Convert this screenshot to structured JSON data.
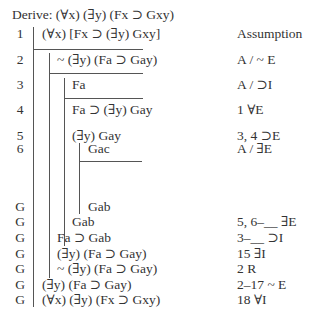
{
  "header": {
    "derive_label": "Derive: (∀x) (∃y) (Fx ⊃ Gxy)"
  },
  "rows": [
    {
      "num": "1",
      "formula": "(∀x) [Fx ⊃ (∃y) Gxy]",
      "just": "Assumption"
    },
    {
      "num": "2",
      "formula": "~ (∃y) (Fa ⊃ Gay)",
      "just": "A / ~ E"
    },
    {
      "num": "3",
      "formula": "Fa",
      "just": "A / ⊃I"
    },
    {
      "num": "4",
      "formula": "Fa ⊃ (∃y) Gay",
      "just": "1 ∀E"
    },
    {
      "num": "5",
      "formula": "(∃y) Gay",
      "just": "3, 4 ⊃E"
    },
    {
      "num": "6",
      "formula": "Gac",
      "just": "A / ∃E"
    },
    {
      "num": "G",
      "formula": "Gab",
      "just": ""
    },
    {
      "num": "G",
      "formula": "Gab",
      "just": "5, 6–__ ∃E"
    },
    {
      "num": "G",
      "formula": "Fa ⊃ Gab",
      "just": "3–__ ⊃I"
    },
    {
      "num": "G",
      "formula": "(∃y) (Fa ⊃ Gay)",
      "just": "15 ∃I"
    },
    {
      "num": "G",
      "formula": "~ (∃y) (Fa ⊃ Gay)",
      "just": "2 R"
    },
    {
      "num": "G",
      "formula": "(∃y) (Fa ⊃ Gay)",
      "just": "2–17 ~ E"
    },
    {
      "num": "G",
      "formula": "(∀x) (∃y) (Fx ⊃ Gxy)",
      "just": "18 ∀I"
    }
  ]
}
